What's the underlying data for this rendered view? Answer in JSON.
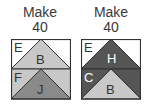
{
  "panels": [
    {
      "title_line1": "Make",
      "title_line2": "40",
      "top_row": {
        "corner_label": "E",
        "triangle_label": "B",
        "corner_color": "#ffffff",
        "triangle_color": "#c8c8c8"
      },
      "bottom_row": {
        "corner_label": "F",
        "triangle_label": "J",
        "corner_color": "#c8c8c8",
        "triangle_color": "#8a8a8a"
      }
    },
    {
      "title_line1": "Make",
      "title_line2": "40",
      "top_row": {
        "corner_label": "E",
        "triangle_label": "H",
        "corner_color": "#ffffff",
        "triangle_color": "#555555"
      },
      "bottom_row": {
        "corner_label": "C",
        "triangle_label": "B",
        "corner_color": "#555555",
        "triangle_color": "#c8c8c8"
      }
    }
  ],
  "colors": {
    "border": "#333333",
    "text": "#3a3a3a"
  }
}
